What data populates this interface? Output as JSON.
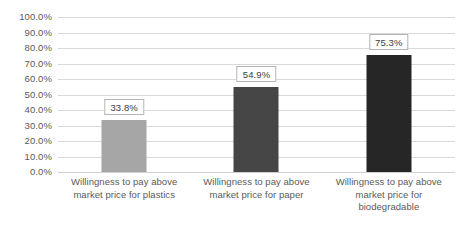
{
  "chart_data": {
    "type": "bar",
    "title": "",
    "subtitle": "",
    "xlabel": "",
    "ylabel": "",
    "ylim": [
      0,
      1.0
    ],
    "grid": true,
    "legend": "none",
    "categories": [
      "Willingness to pay above market price for plastics",
      "Willingness to pay above market price for paper",
      "Willingness to pay above market price for biodegradable"
    ],
    "category_lines": [
      [
        "Willingness to pay above",
        "market price for plastics"
      ],
      [
        "Willingness to pay above",
        "market price for paper"
      ],
      [
        "Willingness to pay above",
        "market price for",
        "biodegradable"
      ]
    ],
    "values": [
      0.338,
      0.549,
      0.753
    ],
    "data_labels": [
      "33.8%",
      "54.9%",
      "75.3%"
    ],
    "bar_colors": [
      "#a6a6a6",
      "#464646",
      "#262626"
    ],
    "y_ticks": [
      {
        "value": 1.0,
        "label": "100.0%"
      },
      {
        "value": 0.9,
        "label": "90.0%"
      },
      {
        "value": 0.8,
        "label": "80.0%"
      },
      {
        "value": 0.7,
        "label": "70.0%"
      },
      {
        "value": 0.6,
        "label": "60.0%"
      },
      {
        "value": 0.5,
        "label": "50.0%"
      },
      {
        "value": 0.4,
        "label": "40.0%"
      },
      {
        "value": 0.3,
        "label": "30.0%"
      },
      {
        "value": 0.2,
        "label": "20.0%"
      },
      {
        "value": 0.1,
        "label": "10.0%"
      },
      {
        "value": 0.0,
        "label": "0.0%"
      }
    ],
    "colors": {
      "background": "#ffffff",
      "gridline": "#d9d9d9",
      "tick_text": "#5a5a5a",
      "label_border": "#b4b4b4",
      "label_text": "#404040"
    }
  }
}
